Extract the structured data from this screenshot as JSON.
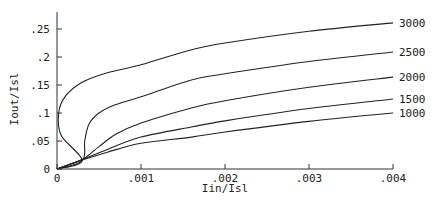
{
  "chart_data": {
    "type": "line",
    "title": "",
    "xlabel": "Iin/Isl",
    "ylabel": "Iout/Isl",
    "xlim": [
      0,
      0.004
    ],
    "ylim": [
      0,
      0.28
    ],
    "grid": false,
    "legend_position": "right (inline labels at line ends)",
    "x_ticks": [
      "0",
      ".001",
      ".002",
      ".003",
      ".004"
    ],
    "y_ticks": [
      "0",
      ".05",
      ".1",
      ".15",
      ".2",
      ".25"
    ],
    "series": [
      {
        "name": "3000",
        "points": [
          [
            0,
            0
          ],
          [
            0.0003,
            0.015
          ],
          [
            5e-05,
            0.06
          ],
          [
            2e-05,
            0.1
          ],
          [
            0.0001,
            0.13
          ],
          [
            0.0003,
            0.155
          ],
          [
            0.0006,
            0.172
          ],
          [
            0.001,
            0.186
          ],
          [
            0.0016,
            0.213
          ],
          [
            0.002,
            0.225
          ],
          [
            0.003,
            0.246
          ],
          [
            0.004,
            0.261
          ]
        ]
      },
      {
        "name": "2500",
        "points": [
          [
            0,
            0
          ],
          [
            0.0003,
            0.015
          ],
          [
            0.00033,
            0.05
          ],
          [
            0.00038,
            0.08
          ],
          [
            0.0005,
            0.1
          ],
          [
            0.0007,
            0.115
          ],
          [
            0.001,
            0.129
          ],
          [
            0.0016,
            0.159
          ],
          [
            0.002,
            0.17
          ],
          [
            0.003,
            0.192
          ],
          [
            0.004,
            0.209
          ]
        ]
      },
      {
        "name": "2000",
        "points": [
          [
            0,
            0
          ],
          [
            0.0003,
            0.017
          ],
          [
            0.0005,
            0.04
          ],
          [
            0.0007,
            0.062
          ],
          [
            0.001,
            0.082
          ],
          [
            0.0016,
            0.109
          ],
          [
            0.002,
            0.122
          ],
          [
            0.003,
            0.146
          ],
          [
            0.004,
            0.164
          ]
        ]
      },
      {
        "name": "1500",
        "points": [
          [
            0,
            0
          ],
          [
            0.0003,
            0.017
          ],
          [
            0.0006,
            0.035
          ],
          [
            0.001,
            0.057
          ],
          [
            0.0016,
            0.075
          ],
          [
            0.002,
            0.086
          ],
          [
            0.003,
            0.108
          ],
          [
            0.004,
            0.125
          ]
        ]
      },
      {
        "name": "1000",
        "points": [
          [
            0,
            0
          ],
          [
            0.0003,
            0.016
          ],
          [
            0.0006,
            0.03
          ],
          [
            0.001,
            0.046
          ],
          [
            0.0016,
            0.057
          ],
          [
            0.002,
            0.066
          ],
          [
            0.003,
            0.085
          ],
          [
            0.004,
            0.1
          ]
        ]
      }
    ]
  },
  "axes": {
    "xlabel": "Iin/Isl",
    "ylabel": "Iout/Isl"
  }
}
